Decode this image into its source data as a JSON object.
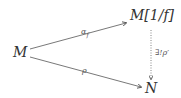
{
  "diagram": {
    "type": "commutative-diagram",
    "nodes": {
      "M": "M",
      "Mf": "M[1/f]",
      "N": "N"
    },
    "edges": [
      {
        "from": "M",
        "to": "M[1/f]",
        "label": "α_f",
        "style": "solid"
      },
      {
        "from": "M",
        "to": "N",
        "label": "ρ",
        "style": "solid"
      },
      {
        "from": "M[1/f]",
        "to": "N",
        "label": "∃!ρ′",
        "style": "dotted"
      }
    ],
    "labels": {
      "alpha_f": "α",
      "alpha_sub": "f",
      "rho": "ρ",
      "exists_unique_rho_prime": "∃!ρ′"
    }
  }
}
